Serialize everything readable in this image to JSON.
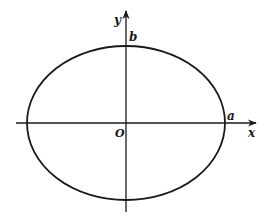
{
  "diagram": {
    "type": "ellipse-on-axes",
    "colors": {
      "stroke": "#1a1a1a",
      "background": "#ffffff"
    },
    "axes": {
      "x_label": "x",
      "y_label": "y",
      "origin_label": "O"
    },
    "ellipse": {
      "semi_major_label": "a",
      "semi_minor_label": "b"
    }
  }
}
